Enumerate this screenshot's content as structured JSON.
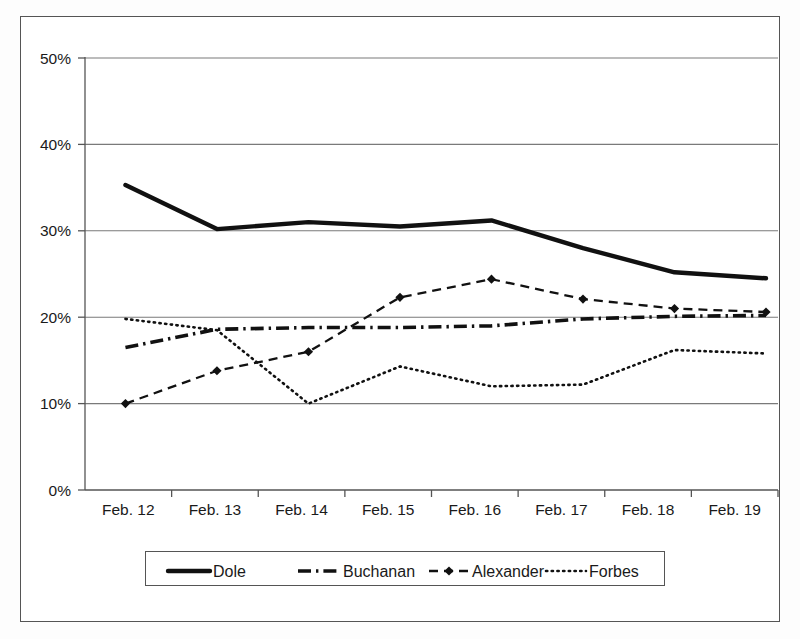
{
  "chart_data": {
    "type": "line",
    "title": "",
    "xlabel": "",
    "ylabel": "",
    "categories": [
      "Feb. 12",
      "Feb. 13",
      "Feb. 14",
      "Feb. 15",
      "Feb. 16",
      "Feb. 17",
      "Feb. 18",
      "Feb. 19"
    ],
    "ylim": [
      0,
      50
    ],
    "ytick_labels": [
      "0%",
      "10%",
      "20%",
      "30%",
      "40%",
      "50%"
    ],
    "ytick_values": [
      0,
      10,
      20,
      30,
      40,
      50
    ],
    "grid": true,
    "legend_position": "bottom",
    "value_suffix": "%",
    "series": [
      {
        "name": "Dole",
        "style": "solid-thick",
        "markers": false,
        "values": [
          35.3,
          30.2,
          31.0,
          30.5,
          31.2,
          28.0,
          25.2,
          24.5
        ]
      },
      {
        "name": "Buchanan",
        "style": "dash-dot",
        "markers": false,
        "values": [
          16.5,
          18.6,
          18.8,
          18.8,
          19.0,
          19.8,
          20.1,
          20.2
        ]
      },
      {
        "name": "Alexander",
        "style": "dashed-with-diamond-markers",
        "markers": true,
        "values": [
          10.0,
          13.8,
          16.0,
          22.3,
          24.4,
          22.1,
          21.0,
          20.6
        ]
      },
      {
        "name": "Forbes",
        "style": "dotted",
        "markers": false,
        "values": [
          19.8,
          18.5,
          10.0,
          14.3,
          12.0,
          12.2,
          16.2,
          15.8
        ]
      }
    ]
  },
  "legend": {
    "entries": [
      {
        "label": "Dole",
        "swatch": "solid-thick-line-swatch"
      },
      {
        "label": "Buchanan",
        "swatch": "dash-dot-line-swatch"
      },
      {
        "label": "Alexander",
        "swatch": "dashed-diamond-line-swatch"
      },
      {
        "label": "Forbes",
        "swatch": "dotted-line-swatch"
      }
    ]
  },
  "colors": {
    "series_line": "#111111",
    "gridline": "#7a7a7a",
    "axis": "#555555",
    "frame": "#555555",
    "background": "#ffffff"
  }
}
